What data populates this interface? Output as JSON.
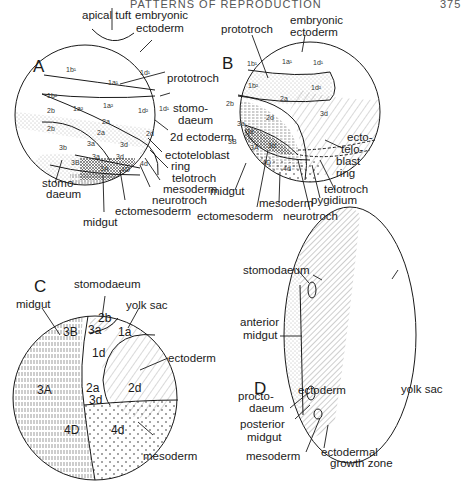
{
  "header": {
    "title": "PATTERNS OF REPRODUCTION",
    "page_number": "375"
  },
  "panels": {
    "A": {
      "letter": "A",
      "labels": {
        "apical_tuft": "apical tuft",
        "embryonic_ectoderm_1": "embryonic",
        "embryonic_ectoderm_2": "ectoderm",
        "prototroch": "prototroch",
        "stomodaeum_r1": "stomo-",
        "stomodaeum_r2": "daeum",
        "ectoderm_2d": "2d ectoderm",
        "ectoteloblast_1": "ectoteloblast",
        "ectoteloblast_2": "ring",
        "telotroch": "telotroch",
        "mesoderm": "mesoderm",
        "neurotroch": "neurotroch",
        "ectomesoderm": "ectomesoderm",
        "midgut": "midgut",
        "stomodaeum_l1": "stomo-",
        "stomodaeum_l2": "daeum"
      },
      "cells": [
        "1b¹",
        "1a¹",
        "1d¹",
        "1b²",
        "1a²",
        "1a²",
        "1d²",
        "1d¹",
        "2b",
        "2a",
        "2b",
        "2a",
        "2d",
        "3a",
        "3d",
        "3b",
        "3a",
        "3d",
        "3B",
        "3A",
        "4D",
        "4d"
      ]
    },
    "B": {
      "letter": "B",
      "labels": {
        "prototroch": "prototroch",
        "embryonic_ectoderm_1": "embryonic",
        "embryonic_ectoderm_2": "ectoderm",
        "ectoteloblast_1": "ecto-",
        "ectoteloblast_2": "telo-",
        "ectoteloblast_3": "blast",
        "ectoteloblast_4": "ring",
        "telotroch": "telotroch",
        "pygidium": "pygidium",
        "neurotroch": "neurotroch",
        "mesoderm": "mesoderm",
        "ectomesoderm": "ectomesoderm",
        "midgut": "midgut"
      },
      "cells": [
        "1b¹",
        "1a¹",
        "1d¹",
        "1b²",
        "1d²",
        "2a",
        "2b",
        "2d",
        "3d",
        "3a",
        "3e",
        "3B",
        "3A",
        "3d",
        "4D",
        "4d"
      ]
    },
    "C": {
      "letter": "C",
      "labels": {
        "stomodaeum": "stomodaeum",
        "midgut": "midgut",
        "yolk_sac": "yolk sac",
        "ectoderm": "ectoderm",
        "mesoderm": "mesoderm"
      },
      "cells": [
        "2b",
        "3a",
        "3B",
        "1a",
        "1d",
        "2a",
        "3d",
        "2d",
        "3A",
        "4D",
        "4d"
      ]
    },
    "D": {
      "letter": "D",
      "labels": {
        "ectoderm": "ectoderm",
        "yolk_sac": "yolk sac",
        "stomodaeum": "stomodaeum",
        "anterior_midgut_1": "anterior",
        "anterior_midgut_2": "midgut",
        "proctodaeum_1": "procto-",
        "proctodaeum_2": "daeum",
        "posterior_midgut_1": "posterior",
        "posterior_midgut_2": "midgut",
        "mesoderm": "mesoderm",
        "ectodermal_gz_1": "ectodermal",
        "ectodermal_gz_2": "growth zone"
      }
    }
  }
}
